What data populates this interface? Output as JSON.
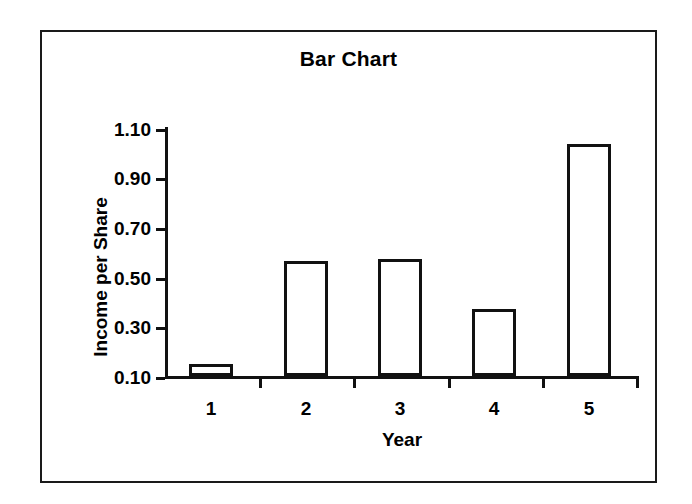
{
  "chart_data": {
    "type": "bar",
    "title": "Bar Chart",
    "xlabel": "Year",
    "ylabel": "Income per Share",
    "categories": [
      "1",
      "2",
      "3",
      "4",
      "5"
    ],
    "values": [
      0.15,
      0.56,
      0.57,
      0.37,
      1.03
    ],
    "ylim": [
      0.1,
      1.1
    ],
    "yticks": [
      "1.10",
      "0.90",
      "0.70",
      "0.50",
      "0.30",
      "0.10"
    ],
    "ytick_values": [
      1.1,
      0.9,
      0.7,
      0.5,
      0.3,
      0.1
    ],
    "grid": false,
    "legend": null,
    "bar_style": {
      "fill": "#ffffff",
      "edge": "#111111"
    },
    "frame": {
      "border_color": "#1a1a1a"
    }
  }
}
